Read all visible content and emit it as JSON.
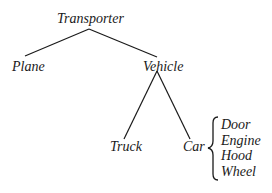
{
  "diagram": {
    "type": "tree",
    "root": {
      "label": "Transporter",
      "children": [
        {
          "label": "Plane"
        },
        {
          "label": "Vehicle",
          "children": [
            {
              "label": "Truck"
            },
            {
              "label": "Car",
              "parts": [
                "Door",
                "Engine",
                "Hood",
                "Wheel"
              ]
            }
          ]
        }
      ]
    },
    "nodes": {
      "transporter": "Transporter",
      "plane": "Plane",
      "vehicle": "Vehicle",
      "truck": "Truck",
      "car": "Car"
    },
    "car_parts": [
      "Door",
      "Engine",
      "Hood",
      "Wheel"
    ],
    "colors": {
      "ink": "#1a1a1a",
      "background": "#ffffff"
    }
  }
}
